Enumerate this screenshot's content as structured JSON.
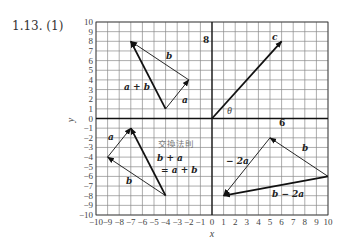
{
  "title": "1.13. (1)",
  "axes": {
    "x_label": "x",
    "y_label": "y",
    "x_range": [
      -10,
      10
    ],
    "y_range": [
      -10,
      10
    ],
    "x_ticks": [
      "-10",
      "-9",
      "-8",
      "-7",
      "-6",
      "-5",
      "-4",
      "-3",
      "-2",
      "-1",
      "0",
      "1",
      "2",
      "3",
      "4",
      "5",
      "6",
      "7",
      "8",
      "9",
      "10"
    ],
    "y_ticks": [
      "10",
      "9",
      "8",
      "7",
      "6",
      "5",
      "4",
      "3",
      "2",
      "1",
      "0",
      "-1",
      "-2",
      "-3",
      "-4",
      "-5",
      "-6",
      "-7",
      "-8",
      "-9",
      "-10"
    ],
    "grid": true
  },
  "vectors": [
    {
      "name": "a",
      "from": [
        -4,
        1
      ],
      "to": [
        -2,
        4
      ],
      "thick": false
    },
    {
      "name": "b",
      "from": [
        -2,
        4
      ],
      "to": [
        -7,
        8
      ],
      "thick": false
    },
    {
      "name": "a+b",
      "from": [
        -4,
        1
      ],
      "to": [
        -7,
        8
      ],
      "thick": true
    },
    {
      "name": "c",
      "from": [
        0,
        0
      ],
      "to": [
        6,
        8
      ],
      "thick": true
    },
    {
      "name": "b",
      "from": [
        -4,
        -8
      ],
      "to": [
        -9,
        -4
      ],
      "thick": false
    },
    {
      "name": "a",
      "from": [
        -9,
        -4
      ],
      "to": [
        -7,
        -1
      ],
      "thick": false
    },
    {
      "name": "b+a",
      "from": [
        -4,
        -8
      ],
      "to": [
        -7,
        -1
      ],
      "thick": true
    },
    {
      "name": "b",
      "from": [
        10,
        -6
      ],
      "to": [
        5,
        -2
      ],
      "thick": false
    },
    {
      "name": "-2a",
      "from": [
        5,
        -2
      ],
      "to": [
        1,
        -8
      ],
      "thick": false
    },
    {
      "name": "b-2a",
      "from": [
        10,
        -6
      ],
      "to": [
        1,
        -8
      ],
      "thick": true
    }
  ],
  "labels": {
    "top_a_plus_b": "a + b",
    "top_b": "b",
    "top_a": "a",
    "c": "c",
    "c_y_component": "8",
    "c_x_component": "6",
    "theta": "θ",
    "bl_a": "a",
    "bl_b": "b",
    "commutative_law": "交換法則",
    "b_plus_a": "b + a",
    "eq_a_plus_b": "= a + b",
    "br_minus_2a": "− 2a",
    "br_b": "b",
    "br_b_minus_2a": "b − 2a"
  },
  "colors": {
    "grid": "#8a8a8a",
    "axis": "#111111",
    "vector": "#111111"
  }
}
